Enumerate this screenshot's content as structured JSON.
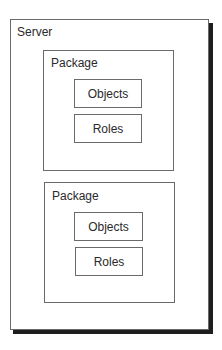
{
  "diagram": {
    "server": {
      "label": "Server"
    },
    "packages": [
      {
        "label": "Package",
        "items": [
          {
            "label": "Objects"
          },
          {
            "label": "Roles"
          }
        ]
      },
      {
        "label": "Package",
        "items": [
          {
            "label": "Objects"
          },
          {
            "label": "Roles"
          }
        ]
      }
    ],
    "colors": {
      "border": "#6a6a6a",
      "shadow": "#1e1e1e",
      "background": "#ffffff"
    }
  }
}
